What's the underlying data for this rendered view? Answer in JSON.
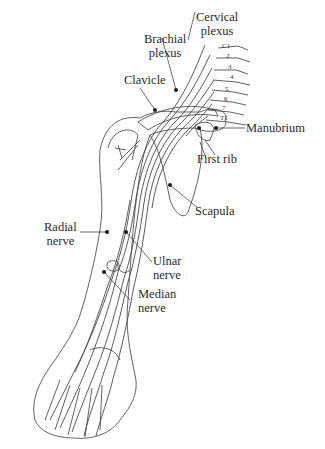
{
  "figure": {
    "type": "anatomical-illustration",
    "labels": {
      "cervical_plexus": [
        "Cervical",
        "plexus"
      ],
      "brachial_plexus": [
        "Brachial",
        "plexus"
      ],
      "clavicle": "Clavicle",
      "manubrium": "Manubrium",
      "first_rib": "First rib",
      "scapula": "Scapula",
      "radial_nerve": [
        "Radial",
        "nerve"
      ],
      "ulnar_nerve": [
        "Ulnar",
        "nerve"
      ],
      "median_nerve": [
        "Median",
        "nerve"
      ]
    },
    "vertebra_labels": [
      "C1",
      "2",
      "3",
      "4",
      "5",
      "6",
      "7",
      "T1"
    ],
    "colors": {
      "line": "#3a3a3a",
      "nerve": "#4a4a4a",
      "background": "#ffffff",
      "text": "#2a2a2a"
    }
  }
}
